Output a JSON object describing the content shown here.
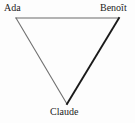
{
  "diagram": {
    "type": "triangle-graph",
    "background_color": "#fdfdfd",
    "nodes": [
      {
        "id": "ada",
        "label": "Ada",
        "position": "top-left",
        "vertex": {
          "x": 16,
          "y": 18
        }
      },
      {
        "id": "benoit",
        "label": "Benoît",
        "position": "top-right",
        "vertex": {
          "x": 119,
          "y": 18
        }
      },
      {
        "id": "claude",
        "label": "Claude",
        "position": "bottom-center",
        "vertex": {
          "x": 67,
          "y": 104
        }
      }
    ],
    "edges": [
      {
        "id": "ada-benoit",
        "from": "ada",
        "to": "benoit",
        "color": "#6b6b6b",
        "width": 1.1
      },
      {
        "id": "ada-claude",
        "from": "ada",
        "to": "claude",
        "color": "#6f6f6f",
        "width": 1.1
      },
      {
        "id": "benoit-claude",
        "from": "benoit",
        "to": "claude",
        "color": "#1a1a1a",
        "width": 1.9
      }
    ]
  }
}
